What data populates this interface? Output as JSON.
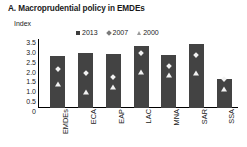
{
  "chart_data": {
    "type": "bar",
    "title": "A. Macroprudential policy in EMDEs",
    "ylabel": "Index",
    "xlabel": "",
    "ylim": [
      0,
      3.5
    ],
    "grid": false,
    "legend_position": "top-center",
    "categories": [
      "EMDEs",
      "ECA",
      "EAP",
      "LAC",
      "MNA",
      "SAR",
      "SSA"
    ],
    "ytick_labels": [
      "3.5",
      "3.0",
      "2.5",
      "2.0",
      "1.5",
      "1.0",
      "0.5",
      "0"
    ],
    "ytick_values": [
      3.5,
      3.0,
      2.5,
      2.0,
      1.5,
      1.0,
      0.5,
      0
    ],
    "series": [
      {
        "name": "2013",
        "marker": "square",
        "render": "bar",
        "color": "#434343",
        "values": [
          2.65,
          2.8,
          2.75,
          3.15,
          2.7,
          3.25,
          1.45
        ]
      },
      {
        "name": "2007",
        "marker": "diamond",
        "render": "marker",
        "color": "#f2f2f2",
        "values": [
          1.95,
          1.75,
          1.55,
          2.75,
          2.1,
          2.65,
          1.45
        ]
      },
      {
        "name": "2000",
        "marker": "triangle",
        "render": "marker",
        "color": "#f2f2f2",
        "values": [
          1.2,
          0.8,
          1.05,
          1.85,
          1.65,
          1.8,
          0.95
        ]
      }
    ]
  },
  "colors": {
    "bar": "#434343",
    "marker": "#f2f2f2",
    "axis": "#000000",
    "text": "#1a1a1a",
    "background": "#ffffff"
  }
}
